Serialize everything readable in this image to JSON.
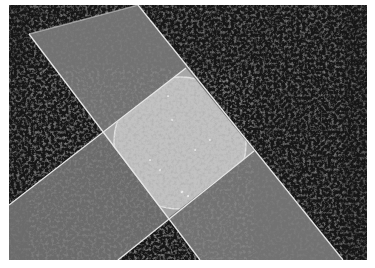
{
  "image": {
    "description": "Two clear glass slides laid in a cross over a dark textured surface, with a circular glass coverslip in the overlapping square",
    "colors": {
      "border": "#ffffff",
      "background_dark": "#1a1a1a",
      "slide_gray": "#6e6e6e",
      "overlap_light": "#b0b0b0",
      "circle_light": "#c4c4c4",
      "edge_highlight": "#e8e8e8"
    }
  },
  "scene": {
    "photo_area": {
      "x": 9,
      "y": 5,
      "width": 358,
      "height": 255
    },
    "vertical_slide": {
      "points": [
        [
          29,
          34
        ],
        [
          138,
          5
        ],
        [
          343,
          260
        ],
        [
          200,
          260
        ]
      ]
    },
    "horizontal_slide": {
      "points": [
        [
          9,
          205
        ],
        [
          186,
          68
        ],
        [
          254,
          151
        ],
        [
          118,
          260
        ],
        [
          9,
          260
        ]
      ]
    },
    "overlap_square": {
      "points": [
        [
          103,
          133
        ],
        [
          186,
          68
        ],
        [
          254,
          151
        ],
        [
          168,
          218
        ]
      ]
    },
    "circle": {
      "cx": 178,
      "cy": 143,
      "rx": 64,
      "ry": 64
    }
  }
}
